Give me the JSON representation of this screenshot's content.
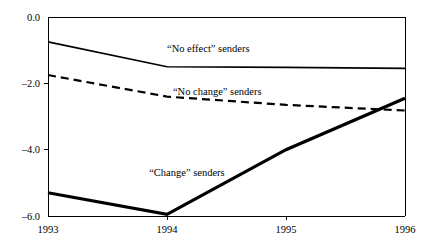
{
  "chart_data": {
    "type": "line",
    "title": "",
    "subtitle": "",
    "xlabel": "",
    "ylabel": "",
    "x": [
      1993,
      1994,
      1995,
      1996
    ],
    "xlim": [
      1993,
      1996
    ],
    "ylim": [
      -6.0,
      0.0
    ],
    "xticks": [
      1993,
      1994,
      1995,
      1996
    ],
    "xtick_labels": [
      "1993",
      "1994",
      "1995",
      "1996"
    ],
    "yticks": [
      0.0,
      -2.0,
      -4.0,
      -6.0
    ],
    "ytick_labels": [
      "0.0",
      "–2.0",
      "–4.0",
      "–6.0"
    ],
    "grid": false,
    "legend_position": "inline-annotations",
    "series": [
      {
        "name": "“No effect” senders",
        "style": "solid-thin",
        "color": "#000000",
        "values": [
          -0.75,
          -1.5,
          -1.52,
          -1.55
        ],
        "annotation": "“No effect” senders",
        "annotation_x": 1994.0,
        "annotation_y": -1.05
      },
      {
        "name": "“No change” senders",
        "style": "dashed",
        "color": "#000000",
        "values": [
          -1.75,
          -2.4,
          -2.65,
          -2.82
        ],
        "annotation": "“No change” senders",
        "annotation_x": 1994.05,
        "annotation_y": -2.35
      },
      {
        "name": "“Change” senders",
        "style": "solid-thick",
        "color": "#000000",
        "values": [
          -5.3,
          -5.95,
          -4.0,
          -2.45
        ],
        "annotation": "“Change” senders",
        "annotation_x": 1993.85,
        "annotation_y": -4.78
      }
    ]
  },
  "colors": {
    "background": "#ffffff",
    "axis": "#000000",
    "text": "#000000",
    "series": "#000000"
  }
}
